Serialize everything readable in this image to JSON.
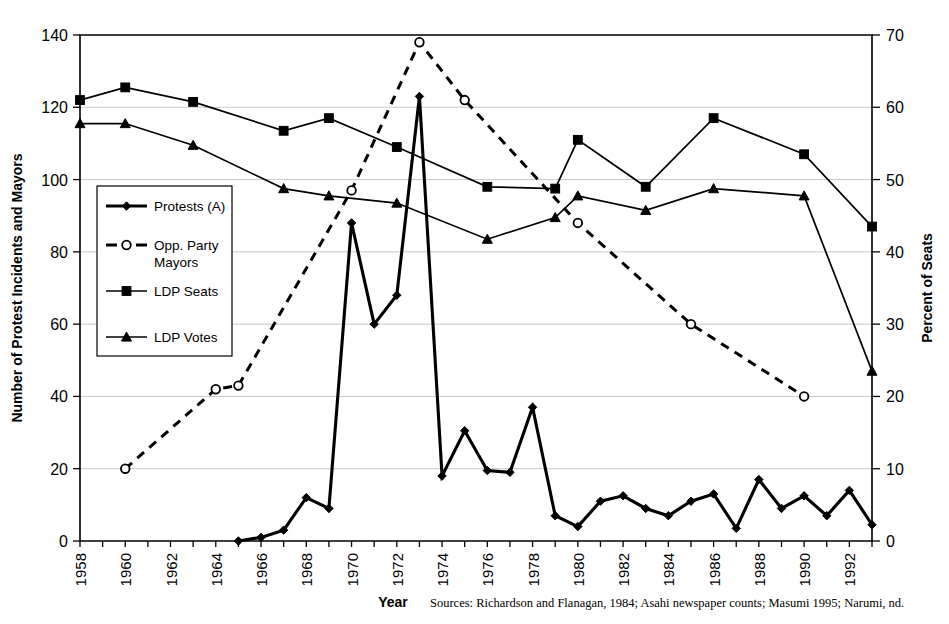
{
  "chart_data": {
    "type": "line",
    "title": "",
    "xlabel": "Year",
    "ylabel": "Number of Protest Incidents and Mayors",
    "y2label": "Percent of Seats",
    "xlim": [
      1958,
      1993
    ],
    "ylim": [
      0,
      140
    ],
    "y2lim": [
      0,
      70
    ],
    "yticks": [
      0,
      20,
      40,
      60,
      80,
      100,
      120,
      140
    ],
    "y2ticks": [
      0,
      10,
      20,
      30,
      40,
      50,
      60,
      70
    ],
    "xticks": [
      1958,
      1960,
      1962,
      1964,
      1966,
      1968,
      1970,
      1972,
      1974,
      1976,
      1978,
      1980,
      1982,
      1984,
      1986,
      1988,
      1990,
      1992
    ],
    "grid": true,
    "legend_position": "left-middle",
    "source_note": "Sources: Richardson and Flanagan, 1984; Asahi newspaper counts; Masumi 1995; Narumi, nd.",
    "series": [
      {
        "name": "Protests (A)",
        "marker": "diamond",
        "style": "solid-thick",
        "axis": "left",
        "x": [
          1965,
          1966,
          1967,
          1968,
          1969,
          1970,
          1971,
          1972,
          1973,
          1974,
          1975,
          1976,
          1977,
          1978,
          1979,
          1980,
          1981,
          1982,
          1983,
          1984,
          1985,
          1986,
          1987,
          1988,
          1989,
          1990,
          1991,
          1992,
          1993
        ],
        "values": [
          0,
          1,
          3,
          12,
          9,
          88,
          60,
          68,
          123,
          18,
          30.5,
          19.5,
          19,
          37,
          7,
          4,
          11,
          12.5,
          9,
          7,
          11,
          13,
          3.5,
          17,
          9,
          12.5,
          7,
          14,
          4.5
        ]
      },
      {
        "name": "Opp. Party Mayors",
        "marker": "circle-open",
        "style": "dashed",
        "axis": "left",
        "x": [
          1960,
          1964,
          1965,
          1970,
          1973,
          1975,
          1980,
          1985,
          1990
        ],
        "values": [
          20,
          42,
          43,
          97,
          138,
          122,
          88,
          60,
          40
        ]
      },
      {
        "name": "LDP Seats",
        "marker": "square",
        "style": "solid-thin",
        "axis": "right",
        "x": [
          1958,
          1960,
          1963,
          1967,
          1969,
          1972,
          1976,
          1979,
          1980,
          1983,
          1986,
          1990,
          1993
        ],
        "values": [
          122,
          125.5,
          121.5,
          113.5,
          117,
          109,
          98,
          97.5,
          111,
          98,
          117,
          107,
          87
        ],
        "percent_values": [
          61,
          62.8,
          60.8,
          56.8,
          58.5,
          54.5,
          49,
          48.8,
          55.5,
          49,
          58.5,
          53.5,
          43.5
        ]
      },
      {
        "name": "LDP Votes",
        "marker": "triangle",
        "style": "solid-thin",
        "axis": "right",
        "x": [
          1958,
          1960,
          1963,
          1967,
          1969,
          1972,
          1976,
          1979,
          1980,
          1983,
          1986,
          1990,
          1993
        ],
        "values": [
          115.5,
          115.5,
          109.5,
          97.5,
          95.5,
          93.5,
          83.5,
          89.5,
          95.5,
          91.5,
          97.5,
          95.5,
          47
        ],
        "percent_values": [
          57.8,
          57.8,
          54.8,
          48.8,
          47.8,
          46.8,
          41.8,
          44.8,
          47.8,
          45.8,
          48.8,
          47.8,
          23.5
        ]
      }
    ],
    "legend_entries": [
      {
        "label": "Protests (A)",
        "marker": "diamond",
        "style": "solid-thick"
      },
      {
        "label": "Opp. Party",
        "label2": "Mayors",
        "marker": "circle-open",
        "style": "dashed"
      },
      {
        "label": "LDP Seats",
        "marker": "square",
        "style": "solid-thin"
      },
      {
        "label": "LDP Votes",
        "marker": "triangle",
        "style": "solid-thin"
      }
    ]
  }
}
